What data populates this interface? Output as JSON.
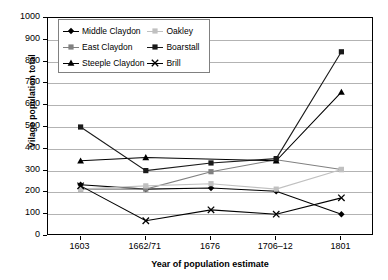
{
  "chart_data": {
    "type": "line",
    "title": "",
    "xlabel": "Year of population estimate",
    "ylabel": "Vilage population total",
    "categories": [
      "1603",
      "1662/71",
      "1676",
      "1706–12",
      "1801"
    ],
    "ylim": [
      0,
      1000
    ],
    "ytick_step": 100,
    "yticks": [
      "1000",
      "900",
      "800",
      "700",
      "600",
      "500",
      "400",
      "300",
      "200",
      "100",
      "0"
    ],
    "grid": true,
    "legend_position": "top-left-inside",
    "series": [
      {
        "name": "Middle Claydon",
        "marker": "diamond",
        "color": "#000000",
        "values": [
          235,
          215,
          220,
          205,
          100
        ]
      },
      {
        "name": "East Claydon",
        "marker": "square",
        "color": "#808080",
        "values": [
          215,
          215,
          295,
          350,
          305
        ]
      },
      {
        "name": "Steeple Claydon",
        "marker": "triangle",
        "color": "#000000",
        "values": [
          345,
          360,
          null,
          345,
          660
        ]
      },
      {
        "name": "Oakley",
        "marker": "square",
        "color": "#c0c0c0",
        "values": [
          215,
          230,
          240,
          215,
          305
        ]
      },
      {
        "name": "Boarstall",
        "marker": "square",
        "color": "#1a1a1a",
        "values": [
          500,
          300,
          335,
          355,
          845
        ]
      },
      {
        "name": "Brill",
        "marker": "cross",
        "color": "#000000",
        "values": [
          230,
          70,
          120,
          100,
          175
        ]
      }
    ]
  },
  "axes": {
    "y_title": "Vilage population total",
    "x_title": "Year of population estimate"
  },
  "legend": {
    "rows": [
      {
        "left": "Middle Claydon",
        "right": "Oakley"
      },
      {
        "left": "East Claydon",
        "right": "Boarstall"
      },
      {
        "left": "Steeple Claydon",
        "right": "Brill"
      }
    ]
  },
  "colors": {
    "gridline": "#b3b3b3",
    "frame": "#000000",
    "legend_border": "#808080",
    "background": "#ffffff"
  }
}
